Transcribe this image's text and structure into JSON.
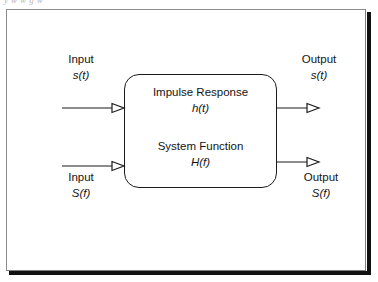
{
  "figure": {
    "caption_remnant": "y   w         w   g   w",
    "colors": {
      "ink": "#141414",
      "frame_light": "#8a8a8a",
      "frame_shadow": "#111111",
      "background": "#ffffff"
    }
  },
  "system_block": {
    "time_domain": {
      "title": "Impulse Response",
      "symbol": "h(t)"
    },
    "frequency_domain": {
      "title": "System Function",
      "symbol": "H(f)"
    }
  },
  "ports": {
    "input_time": {
      "name": "Input",
      "symbol": "s(t)"
    },
    "input_freq": {
      "name": "Input",
      "symbol": "S(f)"
    },
    "output_time": {
      "name": "Output",
      "symbol": "s(t)"
    },
    "output_freq": {
      "name": "Output",
      "symbol": "S(f)"
    }
  },
  "arrows": {
    "input_time_arrow": "arrow-right-hollow-icon",
    "input_freq_arrow": "arrow-right-hollow-icon",
    "output_time_arrow": "arrow-right-hollow-icon",
    "output_freq_arrow": "arrow-right-hollow-icon"
  }
}
